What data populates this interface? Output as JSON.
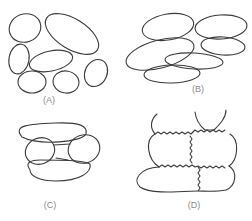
{
  "figure": {
    "panels": [
      {
        "id": "A",
        "label": "(A)",
        "description": "Loosely packed oval cells with gaps between them"
      },
      {
        "id": "B",
        "label": "(B)",
        "description": "Elongated ellipsoid cells stacked and overlapping"
      },
      {
        "id": "C",
        "label": "(C)",
        "description": "Two round cells connected by a short bridge between two elongated cells"
      },
      {
        "id": "D",
        "label": "(D)",
        "description": "Tightly packed cells with wavy interlocking walls"
      }
    ],
    "colors": {
      "stroke": "#3a3a3a",
      "label": "#8a8a8a",
      "background": "#ffffff"
    }
  }
}
